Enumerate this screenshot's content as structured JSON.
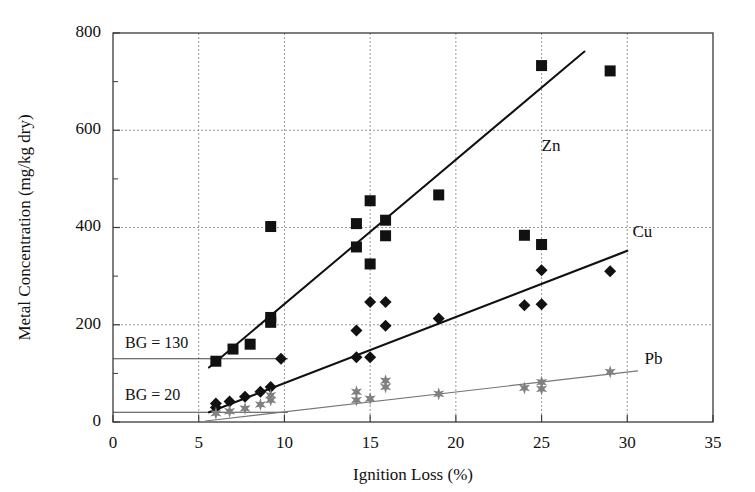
{
  "chart_data": {
    "type": "scatter",
    "title": "",
    "xlabel": "Ignition Loss (%)",
    "ylabel": "Metal Concentration (mg/kg dry)",
    "xlim": [
      0,
      35
    ],
    "ylim": [
      0,
      800
    ],
    "xticks": [
      0,
      5,
      10,
      15,
      20,
      25,
      30,
      35
    ],
    "yticks": [
      0,
      200,
      400,
      600,
      800
    ],
    "xtick_labels": [
      "0",
      "5",
      "10",
      "15",
      "20",
      "25",
      "30",
      "35"
    ],
    "ytick_labels": [
      "0",
      "200",
      "400",
      "600",
      "800"
    ],
    "grid": "dashed-gray-major",
    "minor_y_ticks": [
      100,
      300,
      500,
      700
    ],
    "legend_position": "inline-right-of-trendlines",
    "series": [
      {
        "name": "Zn",
        "marker": "square",
        "color": "#111111",
        "label": "Zn",
        "label_x": 25.0,
        "label_y": 565,
        "points": [
          {
            "x": 6.0,
            "y": 125
          },
          {
            "x": 7.0,
            "y": 150
          },
          {
            "x": 8.0,
            "y": 160
          },
          {
            "x": 9.2,
            "y": 205
          },
          {
            "x": 9.2,
            "y": 215
          },
          {
            "x": 9.2,
            "y": 402
          },
          {
            "x": 14.2,
            "y": 408
          },
          {
            "x": 14.2,
            "y": 360
          },
          {
            "x": 15.0,
            "y": 455
          },
          {
            "x": 15.0,
            "y": 325
          },
          {
            "x": 15.9,
            "y": 415
          },
          {
            "x": 15.9,
            "y": 383
          },
          {
            "x": 19.0,
            "y": 467
          },
          {
            "x": 24.0,
            "y": 384
          },
          {
            "x": 25.0,
            "y": 733
          },
          {
            "x": 25.0,
            "y": 365
          },
          {
            "x": 29.0,
            "y": 722
          }
        ]
      },
      {
        "name": "Cu",
        "marker": "diamond",
        "color": "#111111",
        "label": "Cu",
        "label_x": 30.3,
        "label_y": 388,
        "points": [
          {
            "x": 6.0,
            "y": 30
          },
          {
            "x": 6.0,
            "y": 38
          },
          {
            "x": 6.8,
            "y": 42
          },
          {
            "x": 7.7,
            "y": 52
          },
          {
            "x": 8.6,
            "y": 62
          },
          {
            "x": 9.2,
            "y": 72
          },
          {
            "x": 9.8,
            "y": 130
          },
          {
            "x": 14.2,
            "y": 188
          },
          {
            "x": 14.2,
            "y": 133
          },
          {
            "x": 15.0,
            "y": 247
          },
          {
            "x": 15.0,
            "y": 133
          },
          {
            "x": 15.9,
            "y": 247
          },
          {
            "x": 15.9,
            "y": 198
          },
          {
            "x": 19.0,
            "y": 213
          },
          {
            "x": 24.0,
            "y": 240
          },
          {
            "x": 25.0,
            "y": 312
          },
          {
            "x": 25.0,
            "y": 242
          },
          {
            "x": 29.0,
            "y": 310
          }
        ]
      },
      {
        "name": "Pb",
        "marker": "star",
        "color": "#808080",
        "label": "Pb",
        "label_x": 31.0,
        "label_y": 127,
        "points": [
          {
            "x": 6.0,
            "y": 18
          },
          {
            "x": 6.8,
            "y": 22
          },
          {
            "x": 7.7,
            "y": 28
          },
          {
            "x": 8.6,
            "y": 36
          },
          {
            "x": 9.2,
            "y": 45
          },
          {
            "x": 9.2,
            "y": 55
          },
          {
            "x": 14.2,
            "y": 45
          },
          {
            "x": 14.2,
            "y": 62
          },
          {
            "x": 15.0,
            "y": 48
          },
          {
            "x": 15.9,
            "y": 72
          },
          {
            "x": 15.9,
            "y": 85
          },
          {
            "x": 19.0,
            "y": 58
          },
          {
            "x": 24.0,
            "y": 70
          },
          {
            "x": 25.0,
            "y": 68
          },
          {
            "x": 25.0,
            "y": 82
          },
          {
            "x": 29.0,
            "y": 103
          }
        ]
      }
    ],
    "trendlines": [
      {
        "name": "Zn",
        "x0": 5.6,
        "y0": 112,
        "x1": 27.5,
        "y1": 762,
        "width": 2.0,
        "color": "#111111"
      },
      {
        "name": "Cu",
        "x0": 5.6,
        "y0": 20,
        "x1": 30.0,
        "y1": 352,
        "width": 2.2,
        "color": "#111111"
      },
      {
        "name": "Pb",
        "x0": 5.4,
        "y0": 2,
        "x1": 30.6,
        "y1": 105,
        "width": 1.2,
        "color": "#777777"
      }
    ],
    "reference_lines": [
      {
        "label": "BG = 130",
        "value": 130,
        "x_start": 0,
        "x_end": 10.2,
        "label_x": 0.7,
        "label_y": 160,
        "color": "#444444"
      },
      {
        "label": "BG = 20",
        "value": 20,
        "x_start": 0,
        "x_end": 10.2,
        "label_x": 0.7,
        "label_y": 52,
        "color": "#444444"
      }
    ]
  }
}
